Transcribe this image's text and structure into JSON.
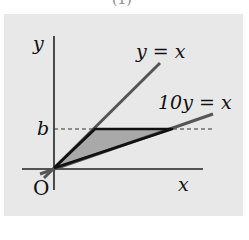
{
  "figure": {
    "top_caption_fragment": "(1)",
    "axes": {
      "x_label": "x",
      "y_label": "y",
      "origin_label": "O",
      "tick_labels": {
        "y_b": "b"
      }
    },
    "curves": [
      {
        "name": "line-y-equals-x",
        "label": "y = x",
        "equation": "y = x"
      },
      {
        "name": "line-10y-equals-x",
        "label": "10y = x",
        "equation": "10y = x"
      }
    ],
    "shaded_region": {
      "description": "Triangle bounded by y = x, 10y = x and y = b",
      "fill": "#a9a9a9",
      "vertices": [
        "O(0,0)",
        "(b,b)",
        "(10b,b)"
      ]
    },
    "guide_lines": [
      {
        "name": "dashed-line-y-b",
        "style": "dashed",
        "value": "y = b"
      }
    ],
    "colors": {
      "panel_bg": "#e8e8e8",
      "line_gray": "#555555",
      "boundary_dark": "#111111",
      "shade": "#a9a9a9"
    }
  }
}
